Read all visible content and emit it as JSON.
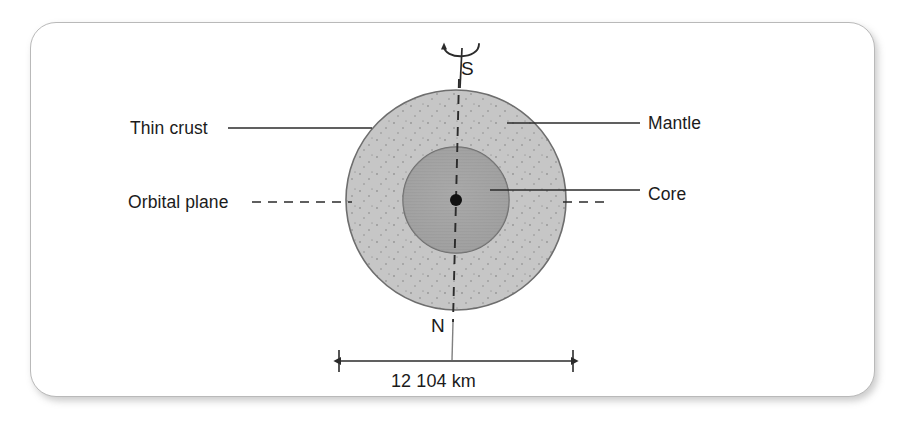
{
  "figure": {
    "card": {
      "background": "#ffffff",
      "border_color": "#b9b9b9"
    }
  },
  "diagram": {
    "type": "cross-section",
    "center": {
      "x": 456,
      "y": 200
    },
    "layers": [
      {
        "name": "mantle",
        "label": "Mantle",
        "radius": 110,
        "fill": "#c6c6c6",
        "stroke": "#6e6e6e",
        "texture": "stipple"
      },
      {
        "name": "core",
        "label": "Core",
        "radius": 53,
        "fill": "#a0a0a0",
        "stroke": "#6e6e6e",
        "texture": "hatch"
      },
      {
        "name": "center-point",
        "label": "",
        "radius": 6,
        "fill": "#111111",
        "stroke": "#111111",
        "texture": "solid"
      }
    ],
    "axis": {
      "name": "rotation-axis",
      "style": "dashed",
      "color": "#2b2b2b",
      "top_pole": "S",
      "bottom_pole": "N"
    },
    "rotation_arrow": {
      "name": "rotation-direction-arrow",
      "color": "#2b2b2b"
    },
    "labels": [
      {
        "id": "thin-crust",
        "text": "Thin crust",
        "side": "left",
        "leader": "solid"
      },
      {
        "id": "orbital-plane",
        "text": "Orbital plane",
        "side": "left",
        "leader": "dashed"
      },
      {
        "id": "mantle",
        "text": "Mantle",
        "side": "right",
        "leader": "solid"
      },
      {
        "id": "core",
        "text": "Core",
        "side": "right",
        "leader": "solid"
      }
    ],
    "dimension": {
      "id": "diameter",
      "text": "12 104 km",
      "value": 12104,
      "unit": "km",
      "arrow_style": "double-headed",
      "color": "#2b2b2b"
    }
  },
  "colors": {
    "mantle_fill": "#c6c6c6",
    "core_fill": "#a0a0a0",
    "outline": "#6e6e6e",
    "line": "#2b2b2b",
    "text": "#1b1b1b",
    "card_border": "#b9b9b9"
  }
}
